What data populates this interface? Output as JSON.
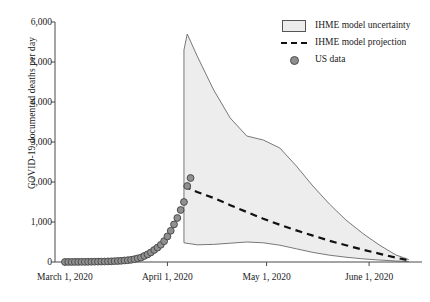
{
  "chart_data": {
    "type": "area",
    "title": "",
    "xlabel": "",
    "ylabel": "COVID-19 documented deaths per day",
    "ylim": [
      0,
      6000
    ],
    "yticks": [
      0,
      1000,
      2000,
      3000,
      4000,
      5000,
      6000
    ],
    "ytick_labels": [
      "0",
      "1,000",
      "2,000",
      "3,000",
      "4,000",
      "5,000",
      "6,000"
    ],
    "xlim_days_from_march1": [
      -3,
      108
    ],
    "xticks_days_from_march1": [
      0,
      31,
      61,
      92
    ],
    "xtick_labels": [
      "March 1, 2020",
      "April 1, 2020",
      "May 1, 2020",
      "June 1, 2020"
    ],
    "grid": false,
    "legend_position": "top-right",
    "legend": [
      {
        "label": "IHME model uncertainty",
        "symbol": "filled-box",
        "color": "#ececec"
      },
      {
        "label": "IHME model projection",
        "symbol": "dashed-line",
        "color": "#111111"
      },
      {
        "label": "US data",
        "symbol": "circle-marker",
        "color": "#8e8e8e"
      }
    ],
    "series": [
      {
        "name": "US data",
        "type": "scatter",
        "color": "#8e8e8e",
        "x_days_from_march1": [
          0,
          1,
          2,
          3,
          4,
          5,
          6,
          7,
          8,
          9,
          10,
          11,
          12,
          13,
          14,
          15,
          16,
          17,
          18,
          19,
          20,
          21,
          22,
          23,
          24,
          25,
          26,
          27,
          28,
          29,
          30,
          31,
          32,
          33,
          34,
          35,
          36,
          37,
          38
        ],
        "values": [
          1,
          2,
          1,
          3,
          2,
          4,
          3,
          5,
          6,
          8,
          9,
          11,
          12,
          15,
          18,
          22,
          25,
          30,
          38,
          45,
          55,
          70,
          90,
          110,
          150,
          190,
          240,
          300,
          360,
          430,
          520,
          640,
          780,
          940,
          1100,
          1300,
          1500,
          1900,
          2100
        ]
      },
      {
        "name": "IHME model projection",
        "type": "line",
        "style": "dashed",
        "color": "#111111",
        "x_days_from_march1": [
          36,
          40,
          45,
          50,
          55,
          60,
          65,
          70,
          75,
          80,
          85,
          90,
          95,
          100,
          104
        ],
        "values": [
          1900,
          1750,
          1600,
          1420,
          1250,
          1080,
          930,
          790,
          660,
          530,
          420,
          310,
          210,
          110,
          40
        ]
      },
      {
        "name": "IHME model uncertainty upper",
        "type": "line",
        "color": "#555555",
        "x_days_from_march1": [
          36,
          37,
          40,
          45,
          50,
          55,
          60,
          65,
          70,
          75,
          80,
          85,
          90,
          95,
          100,
          104
        ],
        "values": [
          5300,
          5700,
          5150,
          4300,
          3600,
          3150,
          3050,
          2850,
          2400,
          1900,
          1450,
          1050,
          720,
          430,
          180,
          60
        ]
      },
      {
        "name": "IHME model uncertainty lower",
        "type": "line",
        "color": "#555555",
        "x_days_from_march1": [
          36,
          40,
          45,
          50,
          55,
          60,
          65,
          70,
          75,
          80,
          85,
          90,
          95,
          100,
          104
        ],
        "values": [
          480,
          430,
          440,
          470,
          500,
          480,
          420,
          330,
          240,
          170,
          120,
          80,
          50,
          25,
          10
        ]
      }
    ]
  }
}
